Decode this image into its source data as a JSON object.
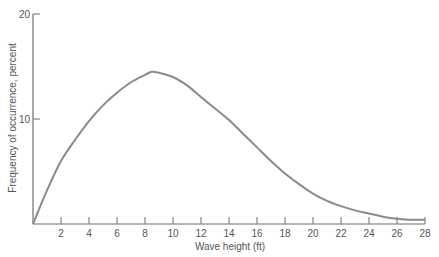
{
  "chart_data": {
    "type": "line",
    "title": "",
    "xlabel": "Wave height (ft)",
    "ylabel": "Frequency of occurrence, percent",
    "xlim": [
      0,
      28
    ],
    "ylim": [
      0,
      20
    ],
    "x_ticks": [
      2,
      4,
      6,
      8,
      10,
      12,
      14,
      16,
      18,
      20,
      22,
      24,
      26,
      28
    ],
    "y_ticks": [
      10,
      20
    ],
    "grid": false,
    "legend": null,
    "series": [
      {
        "name": "Wave height distribution",
        "color": "#8a8a8a",
        "x": [
          0,
          1,
          2,
          3,
          4,
          5,
          6,
          7,
          8,
          8.5,
          9,
          10,
          11,
          12,
          13,
          14,
          15,
          16,
          17,
          18,
          19,
          20,
          21,
          22,
          23,
          24,
          25,
          26,
          27,
          28
        ],
        "y": [
          0,
          3.2,
          6.0,
          8.0,
          9.8,
          11.3,
          12.5,
          13.5,
          14.2,
          14.5,
          14.4,
          14.0,
          13.2,
          12.1,
          11.0,
          9.9,
          8.6,
          7.3,
          6.0,
          4.8,
          3.8,
          2.9,
          2.2,
          1.7,
          1.3,
          1.0,
          0.7,
          0.5,
          0.4,
          0.4
        ]
      }
    ]
  },
  "labels": {
    "x_axis_title": "Wave height (ft)",
    "y_axis_title": "Frequency of occurrence, percent"
  }
}
